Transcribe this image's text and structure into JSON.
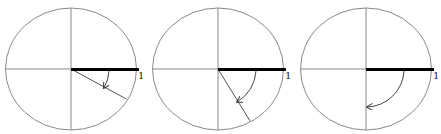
{
  "figure": {
    "panels": [
      {
        "center": [
          71,
          69
        ],
        "radius": 66,
        "angle_deg": 30,
        "unit_label": "1"
      },
      {
        "center": [
          218,
          69
        ],
        "radius": 66,
        "angle_deg": 60,
        "unit_label": "1"
      },
      {
        "center": [
          366,
          69
        ],
        "radius": 66,
        "angle_deg": 90,
        "unit_label": "1"
      }
    ],
    "colors": {
      "circle": "#8a8a8a",
      "radius": "#000000",
      "ray": "#555555",
      "arc": "#444444"
    }
  }
}
